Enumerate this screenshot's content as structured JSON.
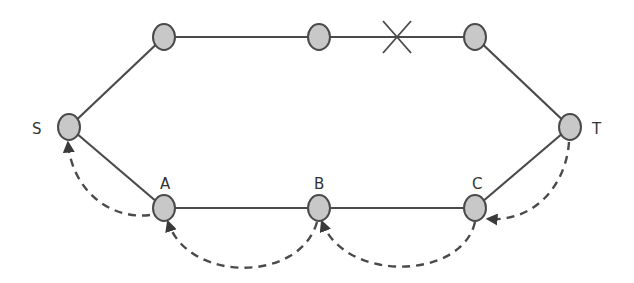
{
  "diagram": {
    "type": "network-path-backtracking",
    "colors": {
      "node_fill": "#c8c8c8",
      "node_stroke": "#4a4a4a",
      "edge": "#4a4a4a",
      "background": "#ffffff"
    },
    "nodes": [
      {
        "id": "S",
        "label": "S",
        "x": 69,
        "y": 127
      },
      {
        "id": "U1",
        "label": "",
        "x": 164,
        "y": 37
      },
      {
        "id": "U2",
        "label": "",
        "x": 319,
        "y": 37
      },
      {
        "id": "U3",
        "label": "",
        "x": 475,
        "y": 37
      },
      {
        "id": "T",
        "label": "T",
        "x": 570,
        "y": 127
      },
      {
        "id": "A",
        "label": "A",
        "x": 164,
        "y": 208
      },
      {
        "id": "B",
        "label": "B",
        "x": 319,
        "y": 208
      },
      {
        "id": "C",
        "label": "C",
        "x": 475,
        "y": 208
      }
    ],
    "edges": [
      {
        "from": "S",
        "to": "U1",
        "style": "solid"
      },
      {
        "from": "U1",
        "to": "U2",
        "style": "solid"
      },
      {
        "from": "U2",
        "to": "U3",
        "style": "solid",
        "broken": true
      },
      {
        "from": "U3",
        "to": "T",
        "style": "solid"
      },
      {
        "from": "S",
        "to": "A",
        "style": "solid"
      },
      {
        "from": "A",
        "to": "B",
        "style": "solid"
      },
      {
        "from": "B",
        "to": "C",
        "style": "solid"
      },
      {
        "from": "C",
        "to": "T",
        "style": "solid"
      }
    ],
    "break_marker": {
      "symbol": "X",
      "x": 397,
      "y": 37,
      "on_edge": "U2-U3"
    },
    "backtrack_arrows": [
      {
        "from": "T",
        "to": "C",
        "style": "dashed"
      },
      {
        "from": "C",
        "to": "B",
        "style": "dashed"
      },
      {
        "from": "B",
        "to": "A",
        "style": "dashed"
      },
      {
        "from": "A",
        "to": "S",
        "style": "dashed"
      }
    ],
    "labels": {
      "S": "S",
      "T": "T",
      "A": "A",
      "B": "B",
      "C": "C"
    }
  }
}
